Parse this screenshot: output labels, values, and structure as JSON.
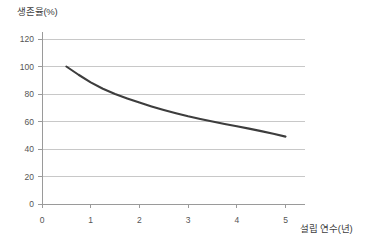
{
  "chart_data": {
    "type": "line",
    "title": "",
    "xlabel": "설립 연수(년)",
    "ylabel": "생존율(%)",
    "xlim": [
      0,
      5.4
    ],
    "ylim": [
      0,
      120
    ],
    "grid": true,
    "legend": false,
    "line_color": "#3d3d3d",
    "grid_color": "#c8c8c8",
    "axis_color": "#9a9a9a",
    "x_ticks": [
      0,
      1,
      2,
      3,
      4,
      5
    ],
    "x_tick_labels": [
      "0",
      "1",
      "2",
      "3",
      "4",
      "5"
    ],
    "y_ticks": [
      0,
      20,
      40,
      60,
      80,
      100,
      120
    ],
    "y_tick_labels": [
      "0",
      "20",
      "40",
      "60",
      "80",
      "100",
      "120"
    ],
    "series": [
      {
        "name": "생존율",
        "x": [
          0.5,
          0.75,
          1.0,
          1.25,
          1.5,
          1.75,
          2.0,
          2.25,
          2.5,
          2.75,
          3.0,
          3.25,
          3.5,
          3.75,
          4.0,
          4.25,
          4.5,
          4.75,
          5.0
        ],
        "values": [
          100.0,
          94.0,
          88.5,
          83.8,
          80.0,
          76.8,
          73.8,
          71.0,
          68.4,
          66.0,
          63.8,
          61.8,
          60.0,
          58.2,
          56.5,
          54.8,
          53.0,
          51.1,
          49.0
        ]
      }
    ]
  }
}
